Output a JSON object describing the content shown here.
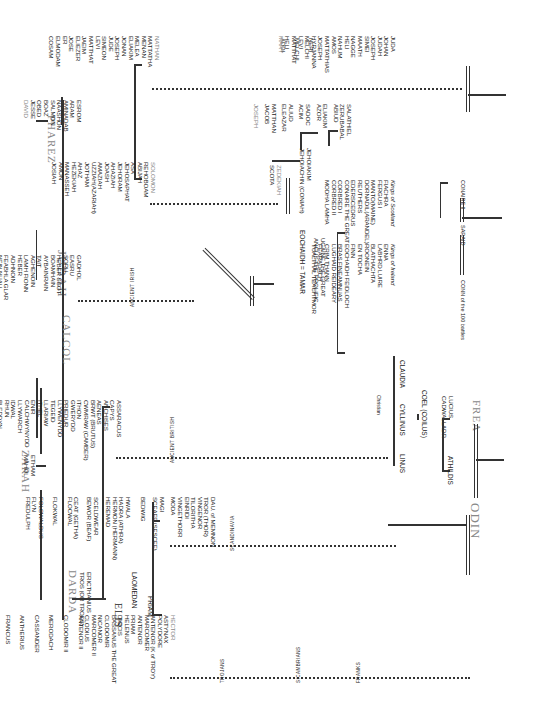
{
  "title": "JUDAH",
  "branches": {
    "pharez": "PHAREZ",
    "zarah": "ZARAH",
    "calcol": "CALCOL",
    "darda": "DARDA",
    "elis": "ELIS",
    "odin": "ODIN",
    "frea": "FREA"
  },
  "pharez_line": [
    "ESROM",
    "ARAM",
    "AMINADAB",
    "NAASHON",
    "SALMON",
    "BOAZ",
    "OBED",
    "JESSE",
    "DAVID"
  ],
  "nathan_line": [
    "NATHAN",
    "MATTATHA",
    "MENAN",
    "MELEA",
    "ELIAKIM",
    "JONAN",
    "JOSEPH",
    "JUDE",
    "SIMEON",
    "LEVI",
    "MATTHAT",
    "JAEIM",
    "ELIEZER",
    "JOSE",
    "ER",
    "ELMODAM",
    "COSAM",
    "ADDI",
    "MELCHI",
    "NERI"
  ],
  "nathan_line2": [
    "JUDA",
    "JOHAN",
    "JUDAH",
    "JOSEPH",
    "SIMEI",
    "MAATH",
    "NAGGE",
    "HELI",
    "NAHUM",
    "AMOS",
    "MATTATHIAS",
    "JOSEPH",
    "HYRJANNA",
    "MELCHI",
    "LEVI",
    "MATTHAT",
    "HELI",
    "MARY"
  ],
  "solomon_line": [
    "SOLOMON",
    "REHOBOAM",
    "ABIJAH",
    "ASA",
    "JEHOSAPHAT",
    "JEHORAM",
    "AHAZIAH",
    "JOASH",
    "AMAZIAH",
    "UZZIAH(AZARIAH)",
    "JOTHAM",
    "AHAZ",
    "HEZEKIAH",
    "MANASSEH",
    "AMON",
    "JOSIAH"
  ],
  "zedekiah": [
    "ZEDEKIAH",
    "SCOTA"
  ],
  "jehoiakim": [
    "JEHOIAKIM",
    "JEHOIACHIN (CONIAH)"
  ],
  "salathiel_line": [
    "SALATHIEL",
    "ZERUBABAL",
    "ABIUD",
    "ELIAKIM",
    "AZOR",
    "SADOC",
    "ACIM",
    "ALIUD",
    "ELEAZAR",
    "MATTHAN",
    "JACOB",
    "JOSEPH"
  ],
  "calcol_line": [
    "GADHOL",
    "EASRU",
    "SORU",
    "HEBER SCOT",
    "BOAMHAIN",
    "AYBAINRAIN",
    "TAIT",
    "AGHENOIN",
    "LAMH FIONN",
    "HEBER",
    "ADHNOIN",
    "FEABHLA GLAR",
    "NEIN NUALL",
    "ALLOID",
    "EARCHADA",
    "DEAGFATHA",
    "BRATHA",
    "BREOGAN",
    "BILLE",
    "GALLAM"
  ],
  "calcol_label": "ANCIENT IRISH",
  "eochaidh": "EOCHAIDH = TAMAR",
  "ugaine": [
    "UGAINE THE GREAT",
    "ANGUS THE PROLIFIC"
  ],
  "kings_ireland": {
    "header": "Kings of Ireland",
    "names": [
      "ENNA",
      "LABHRD LUIRE",
      "BLATHACHTA",
      "ROONEIN",
      "EN TOCHA",
      "FINN",
      "EOCHAIDH FEIDLOCH",
      "BRAS FINEAMNUAS",
      "LUGHAID REIDEARY",
      "CRIM THANN",
      "FEARADACH",
      "TUALTHAL TEACHTMOR"
    ]
  },
  "kings_scotland": {
    "header": "Kings of Scotland",
    "names": [
      "FIACHRA",
      "FERGUS I",
      "MANTO(MAINE)",
      "DORNADIL(ARANDEL)",
      "REUTHERS",
      "EDERSCEDRUS",
      "CONAIRE THE GREAT",
      "CORBRED I",
      "CORBRED II",
      "MODHA LAMHA"
    ]
  },
  "conn": "CONN of the 100 battles",
  "saraid": "SARAID",
  "conaire": "CONAIRE II",
  "zarah_sons": [
    "ETHAM",
    "MAHOL"
  ],
  "darda_sons": [
    "ERICTHANIUS",
    "TROS (OR TROES)"
  ],
  "laomedan": "LAOMEDAN",
  "priam": "PRIAM",
  "ancient_britons_label": "ANCIENT BRITISH",
  "britons": [
    "ASSARACUS",
    "CAPYS",
    "ANCHISES",
    "AENEAS",
    "BRWT (BRUTUS)",
    "CWMRAW (CAMBER)",
    "ITHON",
    "GWERYDD",
    "PRIEDUR",
    "LLYWENYDD",
    "TEGEID",
    "LLARIAW",
    "ITHEL",
    "ENIR",
    "CALCHWYNYDD",
    "LLYWARCH",
    "IDWAL",
    "RHUN",
    "BLEDDYN",
    "MORGAN",
    "BERWYN",
    "CERAINT",
    "BRUTWALE",
    "ALAFON",
    "ANYN",
    "DINGARD",
    "GREIDOL",
    "CERAINT",
    "MEIRION",
    "ARCH",
    "CAID",
    "CAIRLOWYN",
    "BARAN",
    "LEAR",
    "BRAN THE BLESSED",
    "CARADOC I",
    "King in Britain"
  ],
  "christian_note": "Christian",
  "linus": "LINUS",
  "cyllinus": "CYLLINUS",
  "claudia": "CLAUDIA",
  "coel": "COEL (COILUS)",
  "lucius": [
    "LUCIUS",
    "CADWALLADR"
  ],
  "athildis": "ATHILDIS",
  "scand_label": "SCANDINAVIA",
  "scandinavia": [
    "DAU. of MEMNON",
    "TROR (THOR)",
    "VINGENOR",
    "TILORITHA",
    "EINRIDI",
    "VINGETHORR",
    "MODA",
    "MAGI",
    "SCEAFF (SESCEF)",
    "BEDWIG",
    "HWALA",
    "HADRA (ATHRA)",
    "HERMON (HERMANN)",
    "HEREMAD",
    "SCELDWEAR",
    "BEWOR (BEAF)",
    "CEAT (GETHA)",
    "FLOCWAL",
    "FLOKWAL",
    "FOLCWALDUS",
    "FLYN",
    "FREDULPH"
  ],
  "trojan_label": "TROJANS",
  "sicambrian_label": "SICAMBRIANS",
  "franks_label": "FRANKS",
  "trojans": [
    "HECTOR",
    "ASTYNAX",
    "POLYDORE",
    "ANTENOR (K of TROY)",
    "MARCOMER",
    "ANTENOR",
    "PRIAM",
    "HELENUS",
    "DIOCIS",
    "BASSANUS THE GREAT",
    "CLODOMIR",
    "NICANOR",
    "MARCOMER II",
    "CLODIUS",
    "ANTENOR II",
    "CLODOMIR II",
    "MERODACH",
    "CASSANDER",
    "ANTHERIUS",
    "FRANCUS",
    "CLODIUS II",
    "MARCOMER III",
    "CLODOMIR III",
    "ANTENOR IV",
    "RATHERIUS",
    "ODOMAR",
    "MARCOMER IV"
  ]
}
